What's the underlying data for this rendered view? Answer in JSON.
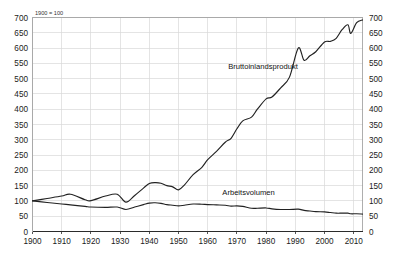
{
  "chart_data": {
    "type": "line",
    "title": "",
    "note": "1900 = 100",
    "xlabel": "",
    "ylabel": "",
    "xlim": [
      1900,
      2013
    ],
    "ylim": [
      0,
      700
    ],
    "grid": true,
    "legend_position": "inline-annotations",
    "x_ticks": [
      "1900",
      "1910",
      "1920",
      "1930",
      "1940",
      "1950",
      "1960",
      "1970",
      "1980",
      "1990",
      "2000",
      "2010"
    ],
    "y_ticks": [
      "0",
      "50",
      "100",
      "150",
      "200",
      "250",
      "300",
      "350",
      "400",
      "450",
      "500",
      "550",
      "600",
      "650",
      "700"
    ],
    "y_ticks_right": [
      "0",
      "50",
      "100",
      "150",
      "200",
      "250",
      "300",
      "350",
      "400",
      "450",
      "500",
      "550",
      "600",
      "650",
      "700"
    ],
    "series": [
      {
        "name": "Bruttoinlandsprodukt",
        "label_x": 1967,
        "label_y": 530,
        "color": "#222222",
        "x": [
          1900,
          1905,
          1910,
          1913,
          1918,
          1920,
          1925,
          1929,
          1932,
          1935,
          1938,
          1940,
          1942,
          1944,
          1946,
          1948,
          1950,
          1952,
          1955,
          1958,
          1960,
          1963,
          1966,
          1968,
          1970,
          1972,
          1975,
          1977,
          1980,
          1982,
          1985,
          1988,
          1991,
          1993,
          1995,
          1997,
          2000,
          2002,
          2004,
          2006,
          2008,
          2009,
          2011,
          2013
        ],
        "values": [
          100,
          108,
          116,
          122,
          104,
          101,
          116,
          122,
          96,
          118,
          142,
          157,
          160,
          158,
          150,
          146,
          136,
          152,
          186,
          210,
          235,
          262,
          292,
          305,
          336,
          362,
          374,
          400,
          434,
          440,
          470,
          505,
          600,
          560,
          575,
          588,
          620,
          622,
          632,
          660,
          676,
          648,
          683,
          692
        ]
      },
      {
        "name": "Arbeitsvolumen",
        "label_x": 1965,
        "label_y": 120,
        "color": "#222222",
        "x": [
          1900,
          1905,
          1910,
          1913,
          1918,
          1920,
          1925,
          1929,
          1932,
          1935,
          1938,
          1940,
          1942,
          1944,
          1946,
          1948,
          1950,
          1952,
          1955,
          1958,
          1960,
          1963,
          1966,
          1968,
          1970,
          1972,
          1975,
          1977,
          1980,
          1982,
          1985,
          1988,
          1991,
          1993,
          1995,
          1997,
          2000,
          2002,
          2004,
          2006,
          2008,
          2009,
          2011,
          2013
        ],
        "values": [
          100,
          95,
          90,
          87,
          82,
          80,
          79,
          80,
          72,
          80,
          88,
          93,
          94,
          92,
          88,
          86,
          84,
          86,
          90,
          89,
          88,
          87,
          86,
          83,
          84,
          82,
          76,
          76,
          77,
          74,
          72,
          72,
          73,
          69,
          67,
          65,
          64,
          62,
          60,
          60,
          60,
          58,
          58,
          57
        ]
      }
    ]
  }
}
